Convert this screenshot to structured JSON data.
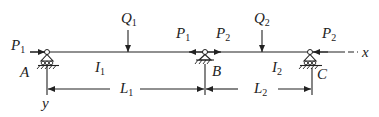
{
  "diagram": {
    "type": "continuous-beam",
    "axes": {
      "x": "x",
      "y": "y"
    },
    "supports": [
      {
        "id": "A",
        "label": "A",
        "kind": "roller"
      },
      {
        "id": "B",
        "label": "B",
        "kind": "pin"
      },
      {
        "id": "C",
        "label": "C",
        "kind": "roller"
      }
    ],
    "spans": [
      {
        "inertia": {
          "sym": "I",
          "sub": "1"
        },
        "length": {
          "sym": "L",
          "sub": "1"
        }
      },
      {
        "inertia": {
          "sym": "I",
          "sub": "2"
        },
        "length": {
          "sym": "L",
          "sub": "2"
        }
      }
    ],
    "loads": {
      "Q1": {
        "sym": "Q",
        "sub": "1"
      },
      "Q2": {
        "sym": "Q",
        "sub": "2"
      },
      "P1_left": {
        "sym": "P",
        "sub": "1"
      },
      "P1_mid": {
        "sym": "P",
        "sub": "1"
      },
      "P2_mid": {
        "sym": "P",
        "sub": "2"
      },
      "P2_right": {
        "sym": "P",
        "sub": "2"
      }
    },
    "colors": {
      "line": "#222222",
      "background": "#ffffff"
    }
  }
}
